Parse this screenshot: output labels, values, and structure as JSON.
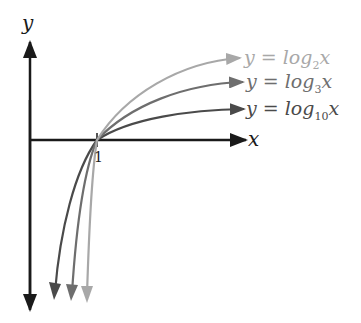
{
  "diagram": {
    "type": "logarithm-graphs",
    "axes": {
      "x_label": "x",
      "y_label": "y",
      "tick_label": "1",
      "axis_color": "#1a1a1a"
    },
    "curves": [
      {
        "id": "log2",
        "prefix": "y = log",
        "base": "2",
        "var": "x",
        "color": "#a8a8a8"
      },
      {
        "id": "log3",
        "prefix": "y = log",
        "base": "3",
        "var": "x",
        "color": "#6e6e6e"
      },
      {
        "id": "log10",
        "prefix": "y = log",
        "base": "10",
        "var": "x",
        "color": "#4a4a4a"
      }
    ]
  }
}
